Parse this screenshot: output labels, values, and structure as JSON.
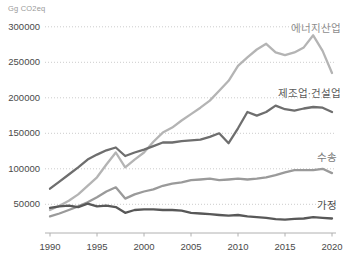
{
  "chart_data": {
    "type": "line",
    "unit_label": "Gg CO2eq",
    "grid": "horizontal-dotted",
    "legend": "end-of-line labels, right side",
    "ylim": [
      0,
      310000
    ],
    "x_years": [
      1990,
      1991,
      1992,
      1993,
      1994,
      1995,
      1996,
      1997,
      1998,
      1999,
      2000,
      2001,
      2002,
      2003,
      2004,
      2005,
      2006,
      2007,
      2008,
      2009,
      2010,
      2011,
      2012,
      2013,
      2014,
      2015,
      2016,
      2017,
      2018,
      2019,
      2020
    ],
    "x_tick_labels": [
      "1990",
      "1995",
      "2000",
      "2005",
      "2010",
      "2015",
      "2020"
    ],
    "y_tick_values": [
      50000,
      100000,
      150000,
      200000,
      250000,
      300000
    ],
    "y_tick_labels": [
      "50000",
      "100000",
      "150000",
      "200000",
      "250000",
      "300000"
    ],
    "series": [
      {
        "key": "energy-industry",
        "name": "에너지산업",
        "color": "#b4b4b4",
        "label_color": "#8e8e8e",
        "values": [
          42000,
          48000,
          55000,
          64000,
          76000,
          88000,
          106000,
          123000,
          102000,
          113000,
          123000,
          138000,
          151000,
          158000,
          168000,
          177000,
          186000,
          196000,
          210000,
          224000,
          245000,
          257000,
          268000,
          276000,
          264000,
          260000,
          264000,
          271000,
          288000,
          266000,
          235000
        ]
      },
      {
        "key": "manufacturing-construction",
        "name": "제조업·건설업",
        "color": "#6e6e6e",
        "label_color": "#5a5a5a",
        "values": [
          72000,
          82000,
          92000,
          102000,
          113000,
          120000,
          126000,
          130000,
          118000,
          123000,
          127000,
          132000,
          137000,
          137000,
          139000,
          140000,
          141000,
          145000,
          150000,
          136000,
          157000,
          180000,
          175000,
          180000,
          189000,
          184000,
          182000,
          185000,
          187000,
          186000,
          180000
        ]
      },
      {
        "key": "transport",
        "name": "수송",
        "color": "#9a9a9a",
        "label_color": "#7b7b7b",
        "values": [
          33000,
          37000,
          42000,
          47000,
          53000,
          60000,
          68000,
          74000,
          58000,
          64000,
          68000,
          71000,
          76000,
          79000,
          81000,
          84000,
          85000,
          86000,
          84000,
          85000,
          86000,
          85000,
          86000,
          88000,
          91000,
          95000,
          98000,
          98000,
          98000,
          100000,
          94000
        ]
      },
      {
        "key": "residential",
        "name": "가정",
        "color": "#585858",
        "label_color": "#4d4d4d",
        "values": [
          45000,
          47000,
          48000,
          46000,
          51000,
          47000,
          48000,
          46000,
          38000,
          42000,
          43000,
          43000,
          42000,
          42000,
          41000,
          38000,
          37000,
          36000,
          35000,
          34000,
          35000,
          33000,
          32000,
          31000,
          29000,
          28500,
          29500,
          30000,
          32000,
          31000,
          30000
        ]
      }
    ]
  }
}
